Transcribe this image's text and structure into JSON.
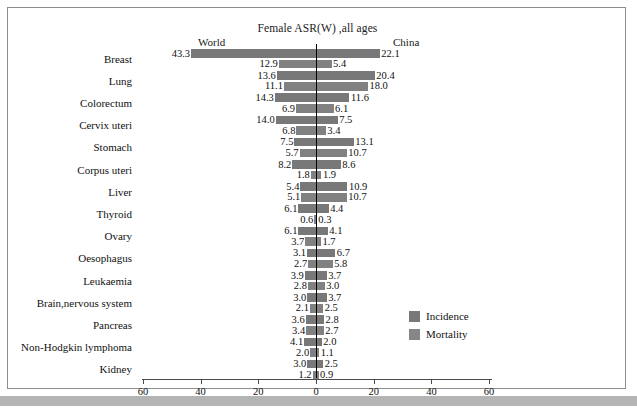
{
  "chart_data": {
    "type": "bar",
    "title": "Female ASR(W) ,all ages",
    "orientation": "horizontal-diverging",
    "left_panel_label": "World",
    "right_panel_label": "China",
    "xlabel": "",
    "ylabel": "",
    "xlim": [
      -60,
      60
    ],
    "xticks": [
      60,
      40,
      20,
      0,
      20,
      40,
      60
    ],
    "grid": false,
    "legend_position": "inside-right",
    "categories": [
      "Breast",
      "Lung",
      "Colorectum",
      "Cervix uteri",
      "Stomach",
      "Corpus uteri",
      "Liver",
      "Thyroid",
      "Ovary",
      "Oesophagus",
      "Leukaemia",
      "Brain,nervous system",
      "Pancreas",
      "Non-Hodgkin lymphoma",
      "Kidney"
    ],
    "series": [
      {
        "name": "Incidence",
        "panel": "World",
        "values": [
          43.3,
          13.6,
          14.3,
          14.0,
          7.5,
          8.2,
          5.4,
          6.1,
          6.1,
          3.1,
          3.9,
          3.0,
          3.6,
          4.1,
          3.0
        ]
      },
      {
        "name": "Mortality",
        "panel": "World",
        "values": [
          12.9,
          11.1,
          6.9,
          6.8,
          5.7,
          1.8,
          5.1,
          0.6,
          3.7,
          2.7,
          2.8,
          2.1,
          3.4,
          2.0,
          1.2
        ]
      },
      {
        "name": "Incidence",
        "panel": "China",
        "values": [
          22.1,
          20.4,
          11.6,
          7.5,
          13.1,
          8.6,
          10.9,
          4.4,
          4.1,
          6.7,
          3.7,
          3.7,
          2.8,
          2.0,
          2.5
        ]
      },
      {
        "name": "Mortality",
        "panel": "China",
        "values": [
          5.4,
          18.0,
          6.1,
          3.4,
          10.7,
          1.9,
          10.7,
          0.3,
          1.7,
          5.8,
          3.0,
          2.5,
          2.7,
          1.1,
          0.9
        ]
      }
    ],
    "legend": [
      "Incidence",
      "Mortality"
    ],
    "colors": {
      "incidence": "#787878",
      "mortality": "#818181",
      "axis": "#4a4a4a",
      "text": "#111111"
    }
  }
}
